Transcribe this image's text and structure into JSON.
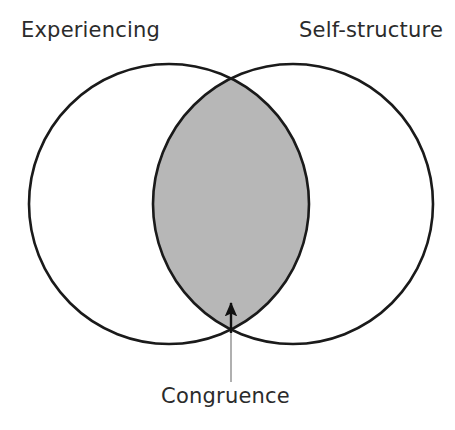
{
  "diagram": {
    "type": "venn-two-circle",
    "title_present": false,
    "background_color": "#ffffff",
    "outline_color": "#1a1a1a",
    "outline_width_px": 2.6,
    "overlap_fill_color": "#b7b7b7",
    "text_color": "#2b2b2b",
    "labels": {
      "left_circle": "Experiencing",
      "right_circle": "Self-structure",
      "overlap": "Congruence"
    },
    "geometry": {
      "left_circle": {
        "cx": 169,
        "cy": 204,
        "r": 140
      },
      "right_circle": {
        "cx": 293,
        "cy": 204,
        "r": 140
      },
      "intersection_top": {
        "x": 231,
        "y": 77
      },
      "intersection_bottom": {
        "x": 231,
        "y": 331
      }
    },
    "annotation_arrow": {
      "from": {
        "x": 231,
        "y": 382
      },
      "to": {
        "x": 231,
        "y": 300
      },
      "points_to": "Congruence",
      "head": "filled-triangle"
    }
  }
}
